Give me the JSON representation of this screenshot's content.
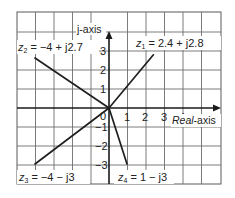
{
  "diagram": {
    "axes": {
      "real_axis_label_italic": "Real",
      "real_axis_label_suffix": "-axis",
      "imag_axis_label": "j-axis",
      "origin_label": "0",
      "x_ticks": [
        "1",
        "2",
        "3",
        "4"
      ],
      "y_ticks_positive": [
        "1",
        "2",
        "3"
      ],
      "y_ticks_negative": [
        "−1",
        "−2",
        "−3"
      ]
    },
    "vectors": [
      {
        "id": "z1",
        "name": "z",
        "subscript": "1",
        "equation": " = 2.4 + j2.8",
        "real": 2.4,
        "imag": 2.8
      },
      {
        "id": "z2",
        "name": "z",
        "subscript": "2",
        "equation": " = −4 + j2.7",
        "real": -4,
        "imag": 2.7
      },
      {
        "id": "z3",
        "name": "z",
        "subscript": "3",
        "equation": " = −4 − j3",
        "real": -4,
        "imag": -3
      },
      {
        "id": "z4",
        "name": "z",
        "subscript": "4",
        "equation": " = 1 − j3",
        "real": 1,
        "imag": -3
      }
    ],
    "colors": {
      "grid": "#6d6d6d",
      "axes": "#1a1a1a",
      "vectors": "#1f1f1f",
      "text": "#222222",
      "background": "#ffffff"
    }
  }
}
